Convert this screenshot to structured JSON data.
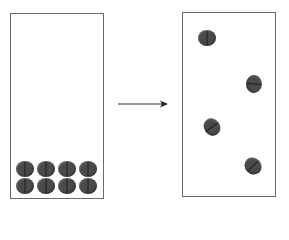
{
  "diagram": {
    "colors": {
      "pill": "#4a4a4a",
      "score_line": "#1e1e1e",
      "border": "#6a6a6a",
      "arrow": "#333333"
    },
    "left_box": {
      "x": 10,
      "y": 13,
      "w": 94,
      "h": 186
    },
    "right_box": {
      "x": 182,
      "y": 12,
      "w": 94,
      "h": 185
    },
    "arrow": {
      "x1": 118,
      "y1": 104,
      "x2": 168,
      "y2": 104,
      "icon": "right-arrow-icon"
    },
    "left_pills": [
      {
        "cx": 25,
        "cy": 169,
        "rot": 0
      },
      {
        "cx": 46,
        "cy": 169,
        "rot": 0
      },
      {
        "cx": 67,
        "cy": 169,
        "rot": 0
      },
      {
        "cx": 88,
        "cy": 169,
        "rot": 0
      },
      {
        "cx": 25,
        "cy": 186,
        "rot": 0
      },
      {
        "cx": 46,
        "cy": 186,
        "rot": 0
      },
      {
        "cx": 67,
        "cy": 186,
        "rot": 0
      },
      {
        "cx": 88,
        "cy": 186,
        "rot": 0
      }
    ],
    "right_pills": [
      {
        "cx": 207,
        "cy": 38,
        "rot": 0
      },
      {
        "cx": 254,
        "cy": 84,
        "rot": 95
      },
      {
        "cx": 212,
        "cy": 127,
        "rot": 55
      },
      {
        "cx": 253,
        "cy": 166,
        "rot": 45
      }
    ],
    "pill_size": {
      "w": 18,
      "h": 16
    }
  }
}
